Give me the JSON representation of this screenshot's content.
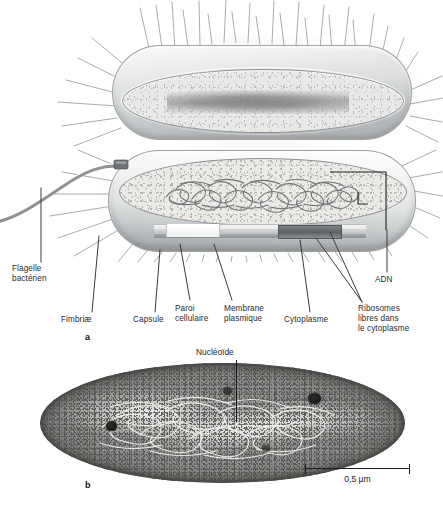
{
  "figure": {
    "panels": [
      {
        "letter": "a",
        "type": "illustration",
        "caption": ""
      },
      {
        "letter": "b",
        "type": "micrograph",
        "caption": ""
      }
    ]
  },
  "panel_a": {
    "letter": "a",
    "labels": [
      {
        "id": "flagelle",
        "text": "Flagelle\nbactérien"
      },
      {
        "id": "fimbriae",
        "text": "Fimbriæ"
      },
      {
        "id": "capsule",
        "text": "Capsule"
      },
      {
        "id": "paroi",
        "text": "Paroi\ncellulaire"
      },
      {
        "id": "membrane",
        "text": "Membrane\nplasmique"
      },
      {
        "id": "cytoplasme",
        "text": "Cytoplasme"
      },
      {
        "id": "ribosomes",
        "text": "Ribosomes\nlibres dans\nle cytoplasme"
      },
      {
        "id": "adn",
        "text": "ADN"
      }
    ]
  },
  "panel_b": {
    "letter": "b",
    "nucleoide_label": "Nucléoïde",
    "scale": {
      "value": "0,5 µm"
    }
  },
  "colors": {
    "ink": "#1d1d1d",
    "label_grey": "#2b2b2b",
    "leader": "#3a3a3a",
    "cell_shell_light": "#fbfbfb",
    "cell_shell_dark": "#a9adaf",
    "cytoplasm": "#e9e9e7",
    "micrograph_dark": "#585856",
    "micrograph_mid": "#8c8c8a"
  }
}
